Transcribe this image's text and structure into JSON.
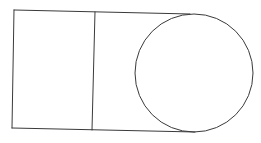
{
  "diagram": {
    "type": "geometry-figure",
    "width": 261,
    "height": 143,
    "stroke_color": "#3a3a3a",
    "background_color": "#ffffff",
    "shapes": {
      "outer_shape": {
        "top_left": [
          14,
          10
        ],
        "bottom_left": [
          12,
          128
        ],
        "top_right": [
          190,
          14
        ],
        "bottom_right": [
          195,
          132
        ]
      },
      "divider": {
        "top": [
          95,
          12
        ],
        "bottom": [
          92,
          130
        ]
      },
      "circle": {
        "cx": 194,
        "cy": 73,
        "r": 59
      }
    },
    "labels": []
  }
}
